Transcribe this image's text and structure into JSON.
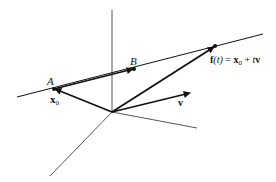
{
  "diagram": {
    "type": "vector-line-3d",
    "labels": {
      "point_a": "A",
      "point_b": "B",
      "x0_base": "x",
      "x0_sub": "0",
      "v": "v",
      "f_lhs": "f",
      "f_arg": "(t)",
      "f_eq": " = ",
      "f_x": "x",
      "f_x_sub": "0",
      "f_plus": " + ",
      "f_t": "t",
      "f_v": "v"
    },
    "points": {
      "origin": [
        112,
        112
      ],
      "A": [
        54,
        89
      ],
      "B": [
        134,
        69
      ],
      "f_t": [
        215,
        46
      ]
    },
    "colors": {
      "stroke": "#111111",
      "axis": "#444444",
      "background": "#ffffff"
    }
  }
}
